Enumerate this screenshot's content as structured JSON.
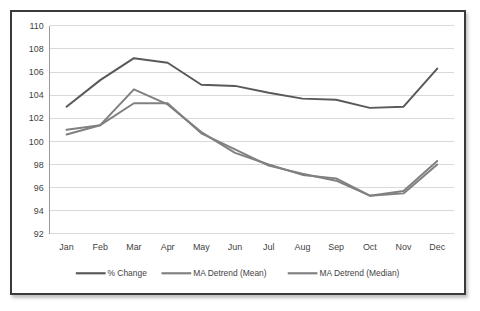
{
  "chart_data": {
    "type": "line",
    "title": "",
    "subtitle": "",
    "xlabel": "",
    "ylabel": "",
    "categories": [
      "Jan",
      "Feb",
      "Mar",
      "Apr",
      "May",
      "Jun",
      "Jul",
      "Aug",
      "Sep",
      "Oct",
      "Nov",
      "Dec"
    ],
    "ylim": [
      92,
      110
    ],
    "ytick_values": [
      92,
      94,
      96,
      98,
      100,
      102,
      104,
      106,
      108,
      110
    ],
    "ytick_labels": [
      "92",
      "94",
      "96",
      "98",
      "100",
      "102",
      "104",
      "106",
      "108",
      "110"
    ],
    "grid": true,
    "grid_axis": "y",
    "legend_position": "bottom",
    "series": [
      {
        "name": "% Change",
        "color": "#595959",
        "values": [
          103.0,
          105.3,
          107.2,
          106.8,
          104.9,
          104.8,
          104.2,
          103.7,
          103.6,
          102.9,
          103.0,
          106.3
        ]
      },
      {
        "name": "MA Detrend (Mean)",
        "color": "#808080",
        "values": [
          101.0,
          101.4,
          104.5,
          103.2,
          100.8,
          99.0,
          98.0,
          97.1,
          96.8,
          95.3,
          95.7,
          98.3
        ]
      },
      {
        "name": "MA Detrend (Median)",
        "color": "#808080",
        "values": [
          100.6,
          101.4,
          103.3,
          103.3,
          100.7,
          99.3,
          97.9,
          97.2,
          96.6,
          95.3,
          95.5,
          98.0
        ]
      }
    ]
  },
  "legend": {
    "items": [
      {
        "label": "% Change"
      },
      {
        "label": "MA Detrend (Mean)"
      },
      {
        "label": "MA Detrend (Median)"
      }
    ]
  },
  "colors": {
    "series_dark": "#595959",
    "series_mid": "#808080",
    "gridline": "#d9d9d9",
    "frame_border": "#3a3a3a",
    "text": "#3f3f3f",
    "background": "#ffffff"
  }
}
